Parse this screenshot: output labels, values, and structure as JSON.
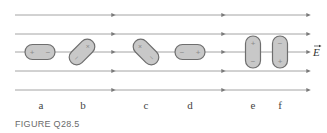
{
  "figure": {
    "caption": "FIGURE Q28.5",
    "field_label": "E",
    "field_label_has_vector_arrow": true,
    "colors": {
      "field_line": "#9a9a9a",
      "dipole_fill": "#c8c8c8",
      "dipole_stroke": "#6e6e6e",
      "caption": "#6a6a6a"
    },
    "field_lines_y": [
      15,
      34,
      52,
      71,
      90
    ],
    "field_line_x_start": 15,
    "field_line_x_end": 309,
    "arrowheads_x": [
      114,
      224,
      309
    ],
    "dipoles": [
      {
        "label": "a",
        "orientation": "horizontal",
        "angle_deg": 0,
        "sign_left_or_top": "+",
        "sign_right_or_bottom": "−",
        "cx": 40,
        "cy": 52
      },
      {
        "label": "b",
        "orientation": "diagonal",
        "angle_deg": -45,
        "sign_left_or_top": "−",
        "sign_right_or_bottom": "+",
        "cx": 82,
        "cy": 52
      },
      {
        "label": "c",
        "orientation": "diagonal",
        "angle_deg": 45,
        "sign_left_or_top": "+",
        "sign_right_or_bottom": "−",
        "cx": 146,
        "cy": 52
      },
      {
        "label": "d",
        "orientation": "horizontal",
        "angle_deg": 0,
        "sign_left_or_top": "−",
        "sign_right_or_bottom": "+",
        "cx": 190,
        "cy": 52
      },
      {
        "label": "e",
        "orientation": "vertical",
        "angle_deg": 90,
        "sign_left_or_top": "+",
        "sign_right_or_bottom": "−",
        "cx": 253,
        "cy": 52
      },
      {
        "label": "f",
        "orientation": "vertical",
        "angle_deg": 90,
        "sign_left_or_top": "−",
        "sign_right_or_bottom": "+",
        "cx": 280,
        "cy": 52
      }
    ],
    "labels": [
      "a",
      "b",
      "c",
      "d",
      "e",
      "f"
    ]
  }
}
